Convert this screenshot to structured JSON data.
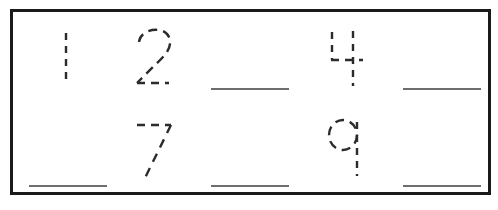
{
  "worksheet": {
    "title": "Number tracing worksheet",
    "border_color": "#1a1a1a",
    "background_color": "#ffffff",
    "trace_color": "#2b2b2b",
    "blank_line_color": "#6e6e6e",
    "rows": [
      {
        "row_label": "row-1",
        "cells": [
          {
            "kind": "traced-digit",
            "value": "1",
            "icon": "dashed-digit-1-icon"
          },
          {
            "kind": "traced-digit",
            "value": "2",
            "icon": "dashed-digit-2-icon"
          },
          {
            "kind": "blank-line",
            "value": "",
            "icon": "blank-writing-line-icon"
          },
          {
            "kind": "traced-digit",
            "value": "4",
            "icon": "dashed-digit-4-icon"
          },
          {
            "kind": "blank-line",
            "value": "",
            "icon": "blank-writing-line-icon"
          }
        ]
      },
      {
        "row_label": "row-2",
        "cells": [
          {
            "kind": "blank-line",
            "value": "",
            "icon": "blank-writing-line-icon"
          },
          {
            "kind": "traced-digit",
            "value": "7",
            "icon": "dashed-digit-7-icon"
          },
          {
            "kind": "blank-line",
            "value": "",
            "icon": "blank-writing-line-icon"
          },
          {
            "kind": "traced-digit",
            "value": "9",
            "icon": "dashed-digit-9-icon"
          },
          {
            "kind": "blank-line",
            "value": "",
            "icon": "blank-writing-line-icon"
          }
        ]
      }
    ]
  }
}
